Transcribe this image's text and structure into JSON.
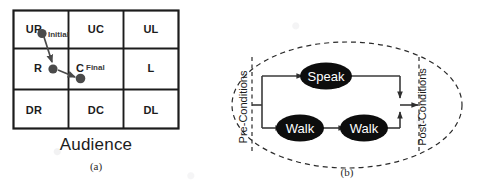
{
  "figure": {
    "panels": [
      {
        "id": "a",
        "caption": "(a)",
        "title": "Audience",
        "grid": {
          "rows": [
            [
              "UR",
              "UC",
              "UL"
            ],
            [
              "R",
              "C",
              "L"
            ],
            [
              "DR",
              "DC",
              "DL"
            ]
          ]
        },
        "markers": [
          {
            "name": "initial",
            "label": "Initial",
            "cell": "UR"
          },
          {
            "name": "intermediate",
            "label": "",
            "cell": "R"
          },
          {
            "name": "final",
            "label": "Final",
            "cell": "C"
          }
        ],
        "path_arrows": [
          {
            "from": "UR",
            "to": "R"
          },
          {
            "from": "R",
            "to": "C"
          }
        ],
        "colors": {
          "grid_line": "#1c1c1c",
          "marker_fill": "#4a4a4a",
          "arrow": "#4a4a4a"
        }
      },
      {
        "id": "b",
        "caption": "(b)",
        "pre_conditions_label": "Pre-Conditions",
        "post_conditions_label": "Post-Conditions",
        "nodes": [
          {
            "name": "speak-node",
            "label": "Speak",
            "branch": "top"
          },
          {
            "name": "walk-node-1",
            "label": "Walk",
            "branch": "bottom"
          },
          {
            "name": "walk-node-2",
            "label": "Walk",
            "branch": "bottom"
          }
        ],
        "edges": [
          {
            "from": "pre-conditions",
            "to": "Speak"
          },
          {
            "from": "pre-conditions",
            "to": "Walk"
          },
          {
            "from": "Walk",
            "to": "Walk"
          },
          {
            "from": "Speak",
            "to": "post-conditions"
          },
          {
            "from": "Walk",
            "to": "post-conditions"
          }
        ],
        "colors": {
          "node_fill": "#0d0d0d",
          "node_text": "#ffffff",
          "edge": "#3a3a3a",
          "boundary": "#2a2a2a"
        }
      }
    ]
  }
}
